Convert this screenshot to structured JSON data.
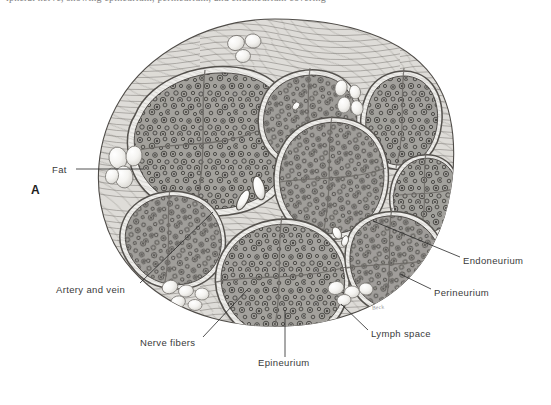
{
  "figure": {
    "panel_letter": "A",
    "signature": "Beck",
    "cropped_caption_fragment": "ipheral nerve, showing epineurium, perineurium, and endoneurium covering"
  },
  "labels": [
    {
      "id": "fat",
      "text": "Fat",
      "x": 52,
      "y": 172,
      "align": "right"
    },
    {
      "id": "artery-and-vein",
      "text": "Artery and vein",
      "x": 56,
      "y": 290,
      "align": "left"
    },
    {
      "id": "nerve-fibers",
      "text": "Nerve fibers",
      "x": 140,
      "y": 343,
      "align": "left"
    },
    {
      "id": "epineurium",
      "text": "Epineurium",
      "x": 258,
      "y": 363,
      "align": "left"
    },
    {
      "id": "lymph-space",
      "text": "Lymph space",
      "x": 371,
      "y": 334,
      "align": "left"
    },
    {
      "id": "endoneurium",
      "text": "Endoneurium",
      "x": 463,
      "y": 261,
      "align": "left"
    },
    {
      "id": "perineurium",
      "text": "Perineurium",
      "x": 434,
      "y": 293,
      "align": "left"
    }
  ],
  "leaders": [
    {
      "id": "fat-leader",
      "points": "76,169 143,169"
    },
    {
      "id": "artery-and-vein-leader",
      "points": "140,283 213,212"
    },
    {
      "id": "nerve-fibers-leader",
      "points": "203,337 247,290"
    },
    {
      "id": "epineurium-leader",
      "points": "285,357 285,310"
    },
    {
      "id": "lymph-space-leader",
      "points": "368,330 341,304"
    },
    {
      "id": "endoneurium-leader",
      "points": "460,257 373,221"
    },
    {
      "id": "perineurium-leader",
      "points": "431,289 400,274"
    }
  ],
  "structures": {
    "nerve_trunk_label": "Peripheral nerve trunk cross section",
    "fascicle_count": 8,
    "fat_globule_clusters": 4,
    "artery_and_vein_count": 2
  },
  "colors": {
    "ink": "#3a3a3a",
    "panel_letter": "#1d1d1d",
    "leader_line": "#262626",
    "epineurium_fill": "#d8d6d2",
    "epineurium_stroke": "#5d5a55",
    "perineurium_fill": "#f2f1ee",
    "fascicle_fill": "#9a9894",
    "fascicle_stroke": "#4a4845",
    "nerve_fiber": "#585654",
    "fat_fill": "#f4f3f0",
    "fat_stroke": "#7e7c78",
    "vessel_fill": "#fbfbfa",
    "background": "#ffffff",
    "signature": "#8d8d8d"
  }
}
